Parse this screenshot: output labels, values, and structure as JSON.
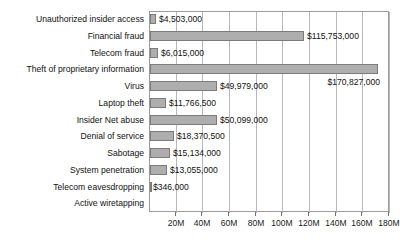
{
  "chart_data": {
    "type": "bar",
    "orientation": "horizontal",
    "title": "",
    "xlabel": "",
    "ylabel": "",
    "xlim": [
      0,
      180000000
    ],
    "xtick_values": [
      20000000,
      40000000,
      60000000,
      80000000,
      100000000,
      120000000,
      140000000,
      160000000,
      180000000
    ],
    "xtick_labels": [
      "20M",
      "40M",
      "60M",
      "80M",
      "100M",
      "120M",
      "140M",
      "160M",
      "180M"
    ],
    "grid": true,
    "legend": "none",
    "bar_color": "#aeaeae",
    "bar_edge_color": "#7b7b7b",
    "axis_color": "#9a9a9a",
    "gridline_color": "#b8b8b8",
    "categories": [
      "Unauthorized insider access",
      "Financial fraud",
      "Telecom fraud",
      "Theft of proprietary information",
      "Virus",
      "Laptop theft",
      "Insider Net abuse",
      "Denial of service",
      "Sabotage",
      "System penetration",
      "Telecom eavesdropping",
      "Active wiretapping"
    ],
    "values": [
      4503000,
      115753000,
      6015000,
      170827000,
      49979000,
      11766500,
      50099000,
      18370500,
      15134000,
      13055000,
      346000,
      0
    ],
    "value_labels": [
      "$4,503,000",
      "$115,753,000",
      "$6,015,000",
      "$170,827,000",
      "$49,979,000",
      "$11,766,500",
      "$50,099,000",
      "$18,370,500",
      "$15,134,000",
      "$13,055,000",
      "$346,000",
      ""
    ],
    "value_label_placement": [
      "right",
      "right",
      "right",
      "below-right",
      "right",
      "right",
      "right",
      "right",
      "right",
      "right",
      "right",
      "none"
    ]
  }
}
